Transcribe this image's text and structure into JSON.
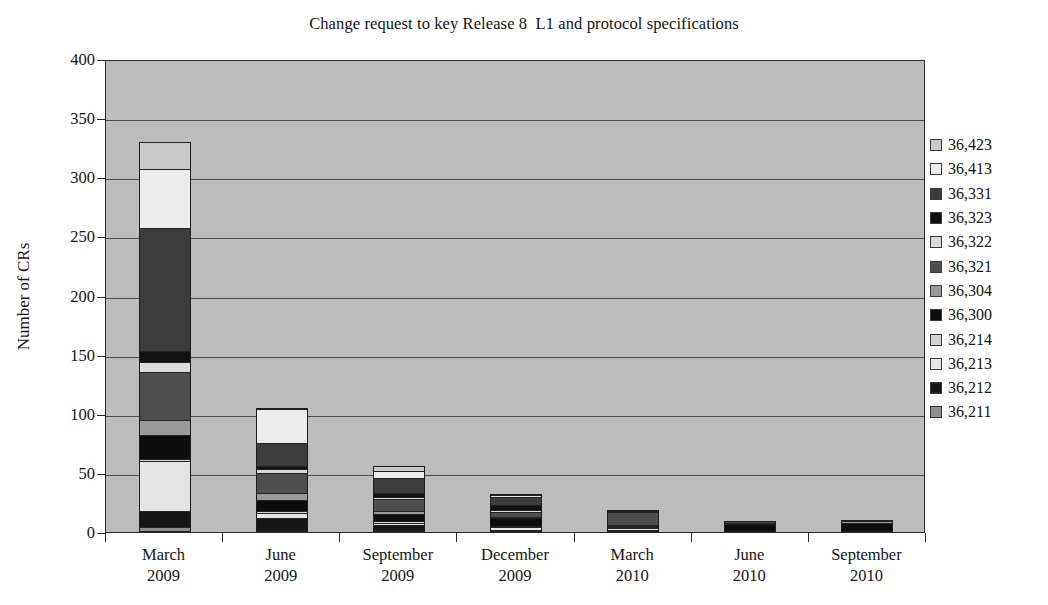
{
  "chart_data": {
    "type": "bar",
    "subtype": "stacked-column",
    "title": "Change request to key Release 8  L1 and protocol specifications",
    "xlabel": "",
    "ylabel": "Number of CRs",
    "ylim": [
      0,
      400
    ],
    "ytick_step": 50,
    "ytick_labels": [
      "400",
      "350",
      "300",
      "250",
      "200",
      "150",
      "100",
      "50",
      "0"
    ],
    "ytick_values": [
      400,
      350,
      300,
      250,
      200,
      150,
      100,
      50,
      0
    ],
    "grid": true,
    "legend_position": "right",
    "categories": [
      "March\n2009",
      "June\n2009",
      "September\n2009",
      "December\n2009",
      "March\n2010",
      "June\n2010",
      "September\n2010"
    ],
    "category_lines": [
      [
        "March",
        "2009"
      ],
      [
        "June",
        "2009"
      ],
      [
        "September",
        "2009"
      ],
      [
        "December",
        "2009"
      ],
      [
        "March",
        "2010"
      ],
      [
        "June",
        "2010"
      ],
      [
        "September",
        "2010"
      ]
    ],
    "series": [
      {
        "name": "36,211",
        "color": "#8f8f8f",
        "values": [
          4,
          2,
          2,
          1,
          1,
          0,
          0
        ]
      },
      {
        "name": "36,212",
        "color": "#161616",
        "values": [
          14,
          10,
          4,
          1,
          1,
          0,
          0
        ]
      },
      {
        "name": "36,213",
        "color": "#e4e4e4",
        "values": [
          42,
          4,
          2,
          2,
          1,
          0,
          1
        ]
      },
      {
        "name": "36,214",
        "color": "#d2d2d2",
        "values": [
          2,
          2,
          1,
          1,
          1,
          0,
          0
        ]
      },
      {
        "name": "36,300",
        "color": "#0d0d0d",
        "values": [
          20,
          9,
          6,
          7,
          1,
          7,
          7
        ]
      },
      {
        "name": "36,304",
        "color": "#9a9a9a",
        "values": [
          13,
          6,
          3,
          1,
          1,
          1,
          1
        ]
      },
      {
        "name": "36,321",
        "color": "#4e4e4e",
        "values": [
          40,
          17,
          10,
          4,
          11,
          1,
          1
        ]
      },
      {
        "name": "36,322",
        "color": "#dadada",
        "values": [
          9,
          3,
          2,
          2,
          0,
          0,
          0
        ]
      },
      {
        "name": "36,323",
        "color": "#111111",
        "values": [
          9,
          3,
          3,
          4,
          1,
          0,
          0
        ]
      },
      {
        "name": "36,331",
        "color": "#3c3c3c",
        "values": [
          104,
          19,
          13,
          7,
          1,
          0,
          0
        ]
      },
      {
        "name": "36,413",
        "color": "#ececec",
        "values": [
          50,
          29,
          6,
          1,
          0,
          0,
          0
        ]
      },
      {
        "name": "36,423",
        "color": "#c9c9c9",
        "values": [
          23,
          1,
          4,
          1,
          0,
          0,
          0
        ]
      }
    ],
    "totals": [
      355,
      105,
      56,
      32,
      19,
      9,
      10
    ]
  },
  "legend": {
    "items": [
      {
        "label": "36,423",
        "color": "#c9c9c9"
      },
      {
        "label": "36,413",
        "color": "#ececec"
      },
      {
        "label": "36,331",
        "color": "#3c3c3c"
      },
      {
        "label": "36,323",
        "color": "#111111"
      },
      {
        "label": "36,322",
        "color": "#dadada"
      },
      {
        "label": "36,321",
        "color": "#4e4e4e"
      },
      {
        "label": "36,304",
        "color": "#9a9a9a"
      },
      {
        "label": "36,300",
        "color": "#0d0d0d"
      },
      {
        "label": "36,214",
        "color": "#d2d2d2"
      },
      {
        "label": "36,213",
        "color": "#e4e4e4"
      },
      {
        "label": "36,212",
        "color": "#161616"
      },
      {
        "label": "36,211",
        "color": "#8f8f8f"
      }
    ]
  },
  "colors": {
    "plot_background": "#bcbcbc",
    "axis": "#2b2b2b",
    "gridline": "#4d4d4d",
    "page_background": "#ffffff",
    "text": "#141414"
  }
}
